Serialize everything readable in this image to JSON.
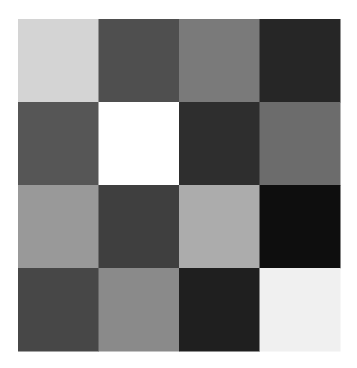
{
  "chart_data": {
    "type": "heatmap",
    "title": "",
    "xlabel": "",
    "ylabel": "",
    "rows": 4,
    "cols": 4,
    "colormap": "grayscale",
    "value_range": [
      0,
      255
    ],
    "values": [
      [
        212,
        79,
        122,
        38
      ],
      [
        86,
        255,
        46,
        108
      ],
      [
        153,
        63,
        172,
        14
      ],
      [
        71,
        138,
        31,
        240
      ]
    ],
    "x_tick_labels": [],
    "y_tick_labels": [],
    "legend": "none",
    "grid": false
  }
}
